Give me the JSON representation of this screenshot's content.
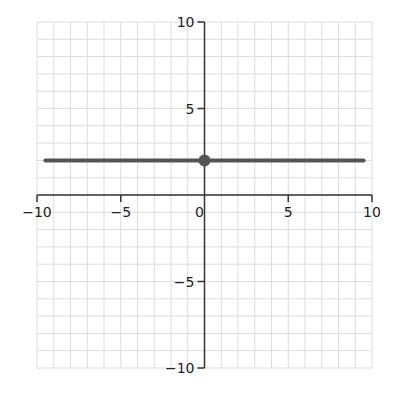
{
  "chart_data": {
    "type": "line",
    "title": "",
    "xlabel": "",
    "ylabel": "",
    "xlim": [
      -10,
      10
    ],
    "ylim": [
      -10,
      10
    ],
    "grid": true,
    "grid_step": 1,
    "x_ticks": [
      -10,
      -5,
      0,
      5,
      10
    ],
    "y_ticks": [
      -10,
      -5,
      5,
      10
    ],
    "x_tick_labels": [
      "−10",
      "−5",
      "0",
      "5",
      "10"
    ],
    "y_tick_labels": [
      "−10",
      "−5",
      "5",
      "10"
    ],
    "series": [
      {
        "name": "horizontal line",
        "equation": "y = 2",
        "x": [
          -9.5,
          9.5
        ],
        "y": [
          2,
          2
        ],
        "color": "#555555"
      }
    ],
    "points": [
      {
        "label": "y-intercept",
        "x": 0,
        "y": 2,
        "color": "#555555"
      }
    ]
  },
  "colors": {
    "grid": "#dcdcdc",
    "axis": "#333333",
    "line": "#555555"
  }
}
